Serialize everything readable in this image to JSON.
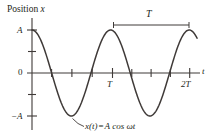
{
  "figure": {
    "axis_titles": {
      "y": "Position x",
      "y_variable": "x",
      "y_prefix": "Position ",
      "x": "t"
    },
    "y_ticks": [
      "A",
      "0",
      "−A"
    ],
    "x_ticks": [
      "T",
      "2T"
    ],
    "period_marker_label": "T",
    "equation": {
      "full": "x(t) = A cos ωt",
      "lhs": "x(t)",
      "equals": "=",
      "rhs": "A cos ωt"
    },
    "colors": {
      "curve": "#3f3a38",
      "axis": "#3f3a38",
      "text": "#231f20",
      "background": "#ffffff"
    }
  },
  "chart_data": {
    "type": "line",
    "title": "",
    "xlabel": "t",
    "ylabel": "Position x",
    "grid": false,
    "legend": null,
    "xlim": [
      0,
      2.18
    ],
    "ylim": [
      -1.28,
      1.28
    ],
    "x_tick_values": [
      1,
      2
    ],
    "x_tick_labels": [
      "T",
      "2T"
    ],
    "x_minor_ticks": [
      0.25,
      0.5,
      0.75,
      1.25,
      1.5,
      1.75
    ],
    "y_tick_values": [
      1,
      0,
      -1
    ],
    "y_tick_labels": [
      "A",
      "0",
      "−A"
    ],
    "y_minor_ticks": [
      0.5,
      -0.5
    ],
    "series": [
      {
        "name": "x(t) = A cos ωt",
        "equation": "x(t) = A cos ωt",
        "amplitude": 1,
        "period": 1,
        "phase": 0,
        "x": [
          0,
          0.05,
          0.1,
          0.15,
          0.2,
          0.25,
          0.3,
          0.35,
          0.4,
          0.45,
          0.5,
          0.55,
          0.6,
          0.65,
          0.7,
          0.75,
          0.8,
          0.85,
          0.9,
          0.95,
          1,
          1.05,
          1.1,
          1.15,
          1.2,
          1.25,
          1.3,
          1.35,
          1.4,
          1.45,
          1.5,
          1.55,
          1.6,
          1.65,
          1.7,
          1.75,
          1.8,
          1.85,
          1.9,
          1.95,
          2,
          2.05,
          2.1
        ],
        "values": [
          1,
          0.951,
          0.809,
          0.588,
          0.309,
          0,
          -0.309,
          -0.588,
          -0.809,
          -0.951,
          -1,
          -0.951,
          -0.809,
          -0.588,
          -0.309,
          0,
          0.309,
          0.588,
          0.809,
          0.951,
          1,
          0.951,
          0.809,
          0.588,
          0.309,
          0,
          -0.309,
          -0.588,
          -0.809,
          -0.951,
          -1,
          -0.951,
          -0.809,
          -0.588,
          -0.309,
          0,
          0.309,
          0.588,
          0.809,
          0.951,
          1,
          0.951,
          0.809
        ]
      }
    ],
    "annotations": [
      {
        "name": "period-span",
        "label": "T",
        "type": "double-ended-span",
        "from_x": 1,
        "to_x": 2,
        "at_y": 1.25
      },
      {
        "name": "equation-callout",
        "label": "x(t) = A cos ωt",
        "points_to_x": 0.5,
        "points_to_y": -1
      }
    ]
  }
}
